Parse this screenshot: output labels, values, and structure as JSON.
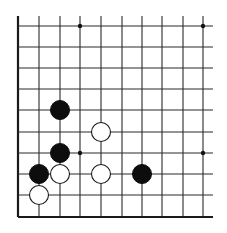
{
  "board": {
    "description": "Go board diagram, lower-left corner section",
    "columns": 10,
    "rows": 10,
    "col_x": [
      18,
      39,
      60,
      80,
      101,
      122,
      142,
      162,
      183,
      203
    ],
    "row_y": [
      26,
      47,
      68,
      89,
      110,
      132,
      153,
      174,
      195,
      217
    ],
    "line_extent": {
      "top": 16,
      "right": 213
    },
    "edges": [
      "left",
      "bottom"
    ],
    "stone_radius": 9.5,
    "star_point_radius": 2.2,
    "colors": {
      "background": "#ffffff",
      "line": "#2a2a2a",
      "black_stone": "#0d0d0d",
      "white_stone_fill": "#ffffff",
      "white_stone_outline": "#1a1a1a"
    }
  },
  "star_points": [
    {
      "col": 3,
      "row": 0
    },
    {
      "col": 9,
      "row": 0
    },
    {
      "col": 3,
      "row": 6
    },
    {
      "col": 9,
      "row": 6
    }
  ],
  "stones": [
    {
      "color": "black",
      "col": 2,
      "row": 4
    },
    {
      "color": "white",
      "col": 4,
      "row": 5
    },
    {
      "color": "black",
      "col": 2,
      "row": 6
    },
    {
      "color": "black",
      "col": 1,
      "row": 7
    },
    {
      "color": "white",
      "col": 2,
      "row": 7
    },
    {
      "color": "white",
      "col": 4,
      "row": 7
    },
    {
      "color": "black",
      "col": 6,
      "row": 7
    },
    {
      "color": "white",
      "col": 1,
      "row": 8
    }
  ]
}
